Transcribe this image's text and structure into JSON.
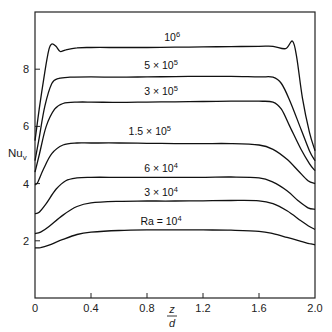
{
  "chart_data": {
    "type": "line",
    "title": "",
    "xlabel": "z/d",
    "xlabel_num": "z",
    "xlabel_den": "d",
    "ylabel": "Nu_v",
    "ylabel_main": "Nu",
    "ylabel_sub": "v",
    "xlim": [
      0,
      2.0
    ],
    "ylim": [
      0,
      10
    ],
    "grid": false,
    "legend": "inline labels above each curve",
    "x_ticks": [
      {
        "value": 0,
        "label": "0"
      },
      {
        "value": 0.4,
        "label": "0.4"
      },
      {
        "value": 0.8,
        "label": "0.8"
      },
      {
        "value": 1.2,
        "label": "1.2"
      },
      {
        "value": 1.6,
        "label": "1.6"
      },
      {
        "value": 2.0,
        "label": "2.0"
      }
    ],
    "y_ticks": [
      {
        "value": 2,
        "label": "2"
      },
      {
        "value": 4,
        "label": "4"
      },
      {
        "value": 6,
        "label": "6"
      },
      {
        "value": 8,
        "label": "8"
      }
    ],
    "series": [
      {
        "name": "Ra = 10^4",
        "label_prefix": "Ra = 10",
        "label_exp": "4",
        "label_pos": [
          0.9,
          2.55
        ],
        "x": [
          0,
          0.04,
          0.1,
          0.2,
          0.3,
          0.4,
          0.6,
          0.8,
          1.0,
          1.2,
          1.4,
          1.6,
          1.7,
          1.8,
          1.9,
          1.96,
          2.0
        ],
        "y": [
          1.75,
          1.76,
          1.85,
          2.05,
          2.22,
          2.3,
          2.36,
          2.38,
          2.38,
          2.38,
          2.37,
          2.33,
          2.25,
          2.12,
          1.98,
          1.9,
          1.86
        ]
      },
      {
        "name": "3 × 10^4",
        "label_prefix": "3 × 10",
        "label_exp": "4",
        "label_pos": [
          0.9,
          3.55
        ],
        "x": [
          0,
          0.04,
          0.1,
          0.2,
          0.3,
          0.4,
          0.6,
          0.8,
          1.0,
          1.2,
          1.4,
          1.6,
          1.7,
          1.8,
          1.9,
          1.96,
          2.0
        ],
        "y": [
          2.25,
          2.3,
          2.5,
          2.9,
          3.2,
          3.33,
          3.38,
          3.39,
          3.39,
          3.4,
          3.41,
          3.4,
          3.3,
          3.05,
          2.7,
          2.5,
          2.4
        ]
      },
      {
        "name": "6 × 10^4",
        "label_prefix": "6 × 10",
        "label_exp": "4",
        "label_pos": [
          0.9,
          4.4
        ],
        "x": [
          0,
          0.03,
          0.08,
          0.15,
          0.22,
          0.3,
          0.4,
          0.6,
          0.8,
          1.0,
          1.2,
          1.4,
          1.6,
          1.7,
          1.8,
          1.88,
          1.95,
          2.0
        ],
        "y": [
          2.95,
          3.0,
          3.3,
          3.8,
          4.1,
          4.2,
          4.22,
          4.22,
          4.22,
          4.22,
          4.22,
          4.23,
          4.2,
          4.05,
          3.75,
          3.4,
          3.15,
          3.1
        ]
      },
      {
        "name": "1.5 × 10^5",
        "label_prefix": "1.5 × 10",
        "label_exp": "5",
        "label_pos": [
          0.82,
          5.7
        ],
        "x": [
          0,
          0.02,
          0.06,
          0.12,
          0.2,
          0.3,
          0.4,
          0.6,
          0.8,
          1.0,
          1.2,
          1.4,
          1.6,
          1.7,
          1.8,
          1.88,
          1.95,
          2.0
        ],
        "y": [
          3.95,
          4.05,
          4.5,
          5.05,
          5.35,
          5.42,
          5.42,
          5.42,
          5.41,
          5.4,
          5.4,
          5.4,
          5.35,
          5.2,
          4.85,
          4.45,
          4.1,
          4.0
        ]
      },
      {
        "name": "3 × 10^5",
        "label_prefix": "3 × 10",
        "label_exp": "5",
        "label_pos": [
          0.9,
          7.1
        ],
        "x": [
          0,
          0.03,
          0.08,
          0.14,
          0.2,
          0.3,
          0.4,
          0.6,
          0.8,
          1.0,
          1.2,
          1.4,
          1.6,
          1.7,
          1.76,
          1.82,
          1.9,
          1.96,
          2.0
        ],
        "y": [
          4.4,
          5.0,
          6.0,
          6.6,
          6.8,
          6.85,
          6.85,
          6.84,
          6.85,
          6.86,
          6.87,
          6.88,
          6.88,
          6.85,
          6.6,
          6.0,
          5.2,
          4.7,
          4.45
        ]
      },
      {
        "name": "5 × 10^5",
        "label_prefix": "5 × 10",
        "label_exp": "5",
        "label_pos": [
          0.9,
          8.0
        ],
        "x": [
          0,
          0.03,
          0.07,
          0.12,
          0.17,
          0.25,
          0.4,
          0.6,
          0.8,
          1.0,
          1.2,
          1.4,
          1.6,
          1.7,
          1.76,
          1.82,
          1.9,
          1.96,
          2.0
        ],
        "y": [
          4.8,
          5.6,
          6.7,
          7.5,
          7.68,
          7.72,
          7.73,
          7.72,
          7.73,
          7.74,
          7.75,
          7.75,
          7.73,
          7.72,
          7.5,
          6.9,
          5.9,
          5.15,
          4.8
        ]
      },
      {
        "name": "10^6",
        "label_prefix": "10",
        "label_exp": "6",
        "label_pos": [
          0.98,
          9.0
        ],
        "x": [
          0,
          0.03,
          0.07,
          0.1,
          0.12,
          0.15,
          0.18,
          0.22,
          0.3,
          0.4,
          0.6,
          0.8,
          1.0,
          1.2,
          1.4,
          1.6,
          1.7,
          1.79,
          1.84,
          1.87,
          1.91,
          1.96,
          2.0
        ],
        "y": [
          5.5,
          6.6,
          7.9,
          8.7,
          8.88,
          8.8,
          8.62,
          8.68,
          8.75,
          8.76,
          8.76,
          8.76,
          8.77,
          8.78,
          8.79,
          8.8,
          8.8,
          8.72,
          8.98,
          8.4,
          7.0,
          5.8,
          5.15
        ]
      }
    ]
  }
}
